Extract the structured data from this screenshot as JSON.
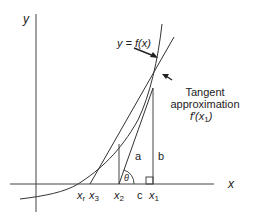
{
  "diagram": {
    "axes": {
      "y_label": "y",
      "x_label": "x"
    },
    "curve_label": "y = f(x)",
    "tangent_label": {
      "line1": "Tangent",
      "line2": "approximation",
      "line3_main": "f′(x",
      "line3_sub": "1",
      "line3_end": ")"
    },
    "x_ticks": [
      {
        "main": "x",
        "sub": "r"
      },
      {
        "main": "x",
        "sub": "3"
      },
      {
        "main": "x",
        "sub": "2"
      },
      {
        "main": "c",
        "sub": ""
      },
      {
        "main": "x",
        "sub": "1"
      }
    ],
    "segment_labels": {
      "a": "a",
      "b": "b",
      "theta": "θ"
    },
    "colors": {
      "line": "#333333",
      "background": "#ffffff"
    }
  }
}
